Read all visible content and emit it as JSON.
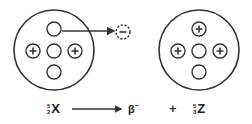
{
  "diagram": {
    "title": "",
    "parent_nucleus": {
      "protons": 2,
      "neutrons": 3,
      "mass_number": "5",
      "atomic_number": "2",
      "symbol": "X"
    },
    "daughter_nucleus": {
      "protons": 3,
      "neutrons": 2,
      "mass_number": "5",
      "atomic_number": "3",
      "symbol": "Z"
    },
    "emitted_particle": {
      "symbol": "β",
      "charge": "−",
      "shape_label": "−"
    },
    "equation": {
      "arrow": "→",
      "plus": "+"
    },
    "colors": {
      "stroke": "#333333",
      "background": "#ffffff"
    }
  }
}
